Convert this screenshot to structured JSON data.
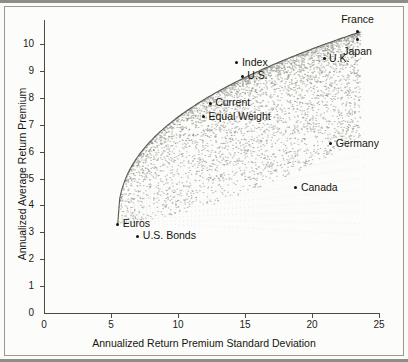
{
  "chart_data": {
    "type": "scatter",
    "title": "",
    "xlabel": "Annualized Return Premium Standard Deviation",
    "ylabel": "Annualized Average Return Premium",
    "xlim": [
      0,
      25
    ],
    "ylim": [
      0,
      10.6
    ],
    "xticks": [
      0,
      5,
      10,
      15,
      20,
      25
    ],
    "yticks": [
      0,
      1,
      2,
      3,
      4,
      5,
      6,
      7,
      8,
      9,
      10
    ],
    "xtick_labels": [
      "0",
      "5",
      "10",
      "15",
      "20",
      "25"
    ],
    "ytick_labels": [
      "0",
      "1",
      "2",
      "3",
      "4",
      "5",
      "6",
      "7",
      "8",
      "9",
      "10"
    ],
    "grid": false,
    "legend": "none",
    "annotations": "Dense grey point cloud forms an upward-curving region (feasible portfolio set) whose upper-left boundary is an efficient-frontier style envelope running from the Euros point up toward France/Japan.",
    "labeled_points": [
      {
        "name": "France",
        "x": 23.4,
        "y": 10.45,
        "label_position": "above"
      },
      {
        "name": "Japan",
        "x": 23.4,
        "y": 10.15,
        "label_position": "below"
      },
      {
        "name": "U.K.",
        "x": 20.9,
        "y": 9.45,
        "label_position": "right"
      },
      {
        "name": "Index",
        "x": 14.4,
        "y": 9.3,
        "label_position": "right"
      },
      {
        "name": "U.S.",
        "x": 14.8,
        "y": 8.8,
        "label_position": "right"
      },
      {
        "name": "Current",
        "x": 12.4,
        "y": 7.8,
        "label_position": "right"
      },
      {
        "name": "Equal Weight",
        "x": 11.9,
        "y": 7.3,
        "label_position": "right"
      },
      {
        "name": "Germany",
        "x": 21.4,
        "y": 6.3,
        "label_position": "right"
      },
      {
        "name": "Canada",
        "x": 18.8,
        "y": 4.65,
        "label_position": "right"
      },
      {
        "name": "Euros",
        "x": 5.5,
        "y": 3.3,
        "label_position": "right"
      },
      {
        "name": "U.S. Bonds",
        "x": 7.0,
        "y": 2.85,
        "label_position": "right"
      }
    ],
    "cloud": {
      "description": "grey simulated-portfolio point cloud",
      "color": "#8d8d86",
      "frontier_color": "#5c5c57",
      "approx_point_count": 4000
    },
    "colors": {
      "axis": "#4a4a46",
      "text": "#15150f",
      "marker": "#121210",
      "background": "#fcfcfa",
      "frame": "#9a9a93"
    }
  }
}
